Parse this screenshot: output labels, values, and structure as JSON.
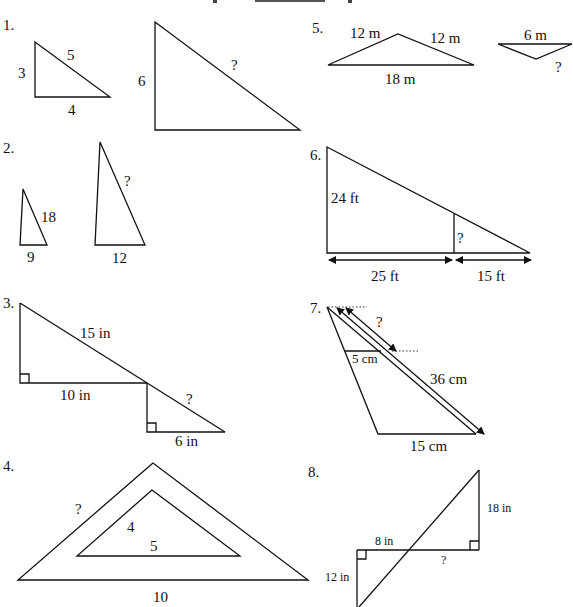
{
  "page": {
    "problems": [
      {
        "number": "1.",
        "small": {
          "sides": [
            "3",
            "5",
            "4"
          ]
        },
        "large": {
          "sides": [
            "6",
            "?"
          ]
        }
      },
      {
        "number": "2.",
        "small": {
          "sides": [
            "18",
            "9"
          ]
        },
        "large": {
          "sides": [
            "?",
            "12"
          ]
        }
      },
      {
        "number": "3.",
        "labels": [
          "15 in",
          "10 in",
          "?",
          "6 in"
        ]
      },
      {
        "number": "4.",
        "labels": [
          "?",
          "4",
          "5",
          "10"
        ]
      },
      {
        "number": "5.",
        "large": {
          "sides": [
            "12 m",
            "12 m",
            "18 m"
          ]
        },
        "small": {
          "sides": [
            "6 m",
            "?"
          ]
        }
      },
      {
        "number": "6.",
        "labels": [
          "24 ft",
          "?",
          "25 ft",
          "15 ft"
        ]
      },
      {
        "number": "7.",
        "labels": [
          "?",
          "5 cm",
          "36 cm",
          "15 cm"
        ]
      },
      {
        "number": "8.",
        "labels": [
          "18 in",
          "8 in",
          "?",
          "12 in"
        ]
      }
    ]
  }
}
